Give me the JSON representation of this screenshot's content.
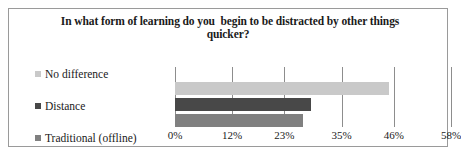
{
  "chart_data": {
    "type": "bar",
    "orientation": "horizontal",
    "title": "In what form of learning do you  begin to be distracted by other things quicker?",
    "title_line1": "In what form of learning do you  begin to be distracted by other things",
    "title_line2": "quicker?",
    "xlabel": "",
    "ylabel": "",
    "categories": [
      "No difference",
      "Distance",
      "Traditional (offline)"
    ],
    "values": [
      45,
      28.6,
      27
    ],
    "value_labels": [
      "45%",
      "29%",
      "27%"
    ],
    "xlim": [
      0,
      58
    ],
    "xticks": [
      0,
      12,
      23,
      35,
      46,
      58
    ],
    "xtick_labels": [
      "0%",
      "12%",
      "23%",
      "35%",
      "46%",
      "58%"
    ],
    "grid": true,
    "grid_axis": "x",
    "legend_position": "left",
    "series_colors": [
      "#c9c9c9",
      "#484848",
      "#808080"
    ],
    "bar_order_top_to_bottom": [
      "No difference",
      "Distance",
      "Traditional (offline)"
    ]
  },
  "legend": {
    "items": [
      {
        "label": "No difference",
        "color": "#c9c9c9"
      },
      {
        "label": "Distance",
        "color": "#484848"
      },
      {
        "label": "Traditional (offline)",
        "color": "#808080"
      }
    ]
  },
  "colors": {
    "frame_border": "#9a9a9a",
    "gridline": "#8d8d8d",
    "text": "#1a1a1a",
    "background": "#ffffff"
  }
}
